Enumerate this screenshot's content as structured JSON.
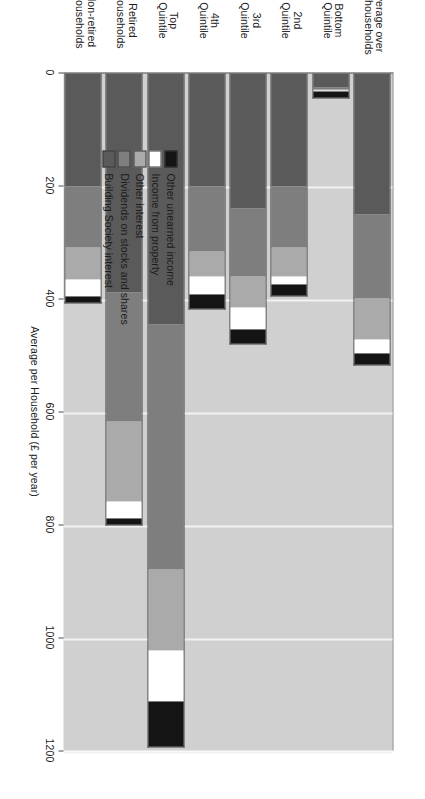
{
  "chart_data": {
    "type": "bar",
    "orientation": "vertical-stacked",
    "title": "",
    "xlabel": "Quintile groups of Households ranked by oringinal Income.",
    "ylabel": "Average per Household (£ per year)",
    "ylim": [
      0,
      1200
    ],
    "yticks": [
      "0",
      "200",
      "400",
      "600",
      "800",
      "1000",
      "1200"
    ],
    "ytick_values": [
      0,
      200,
      400,
      600,
      800,
      1000,
      1200
    ],
    "grid": true,
    "legend_position": "inside-upper-left",
    "categories": [
      "Average over\nall households",
      "Bottom\nQuintile",
      "2nd\nQuintile",
      "3rd\nQuintile",
      "4th\nQuintile",
      "Top\nQuintile",
      "Retired\nHouseholds",
      "Non-retired\nHouseholds"
    ],
    "category_labels": [
      {
        "line1": "Average over",
        "line2": "all households"
      },
      {
        "line1": "Bottom",
        "line2": "Quintile"
      },
      {
        "line1": "2nd",
        "line2": "Quintile"
      },
      {
        "line1": "3rd",
        "line2": "Quintile"
      },
      {
        "line1": "4th",
        "line2": "Quintile"
      },
      {
        "line1": "Top",
        "line2": "Quintile"
      },
      {
        "line1": "Retired",
        "line2": "Households"
      },
      {
        "line1": "Non-retired",
        "line2": "Households"
      }
    ],
    "series": [
      {
        "name": "Building Society interest",
        "color": "#5a5a5a",
        "values": [
          251,
          26,
          200,
          240,
          200,
          444,
          389,
          200
        ]
      },
      {
        "name": "Dividends on stocks and shares",
        "color": "#7e7e7e",
        "values": [
          149,
          4,
          109,
          120,
          116,
          436,
          229,
          109
        ]
      },
      {
        "name": "Other interest",
        "color": "#aaaaaa",
        "values": [
          73,
          2,
          51,
          55,
          44,
          142,
          142,
          58
        ]
      },
      {
        "name": "Income from property",
        "color": "#ffffff",
        "values": [
          25,
          2,
          15,
          40,
          33,
          91,
          29,
          29
        ]
      },
      {
        "name": "Other unearned income",
        "color": "#141414",
        "values": [
          18,
          11,
          20,
          25,
          25,
          80,
          11,
          11
        ]
      }
    ],
    "totals": [
      516,
      45,
      395,
      480,
      418,
      1193,
      800,
      407
    ]
  },
  "legend": {
    "items": [
      {
        "label": "Other unearned income",
        "color": "#141414"
      },
      {
        "label": "Income from property",
        "color": "#ffffff"
      },
      {
        "label": "Other interest",
        "color": "#aaaaaa"
      },
      {
        "label": "Dividends on stocks and shares",
        "color": "#7e7e7e"
      },
      {
        "label": "Building Society interest",
        "color": "#5a5a5a"
      }
    ]
  },
  "colors": {
    "plot_background": "#d0d0d0",
    "page_background": "#ffffff",
    "gridline": "#f2f2f2",
    "axis": "#555555",
    "text": "#1c1c1c"
  }
}
